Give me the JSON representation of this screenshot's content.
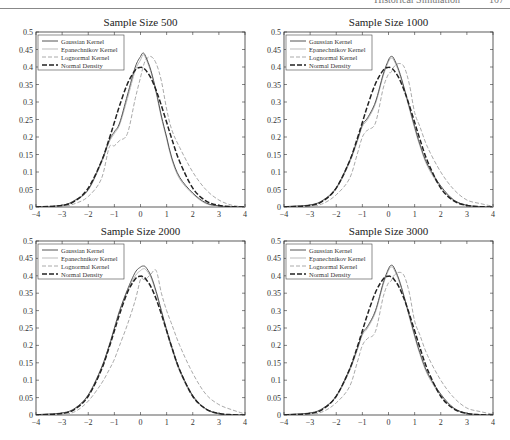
{
  "header": {
    "running_title": "Historical Simulation",
    "page_number": "107"
  },
  "legend": [
    "Gaussian Kernel",
    "Epanechnikov Kernel",
    "Lognormal Kernel",
    "Normal Density"
  ],
  "series_styles": {
    "Gaussian Kernel": {
      "color": "#555555",
      "dash": "",
      "width": 1.0
    },
    "Epanechnikov Kernel": {
      "color": "#bbbbbb",
      "dash": "",
      "width": 1.0
    },
    "Lognormal Kernel": {
      "color": "#aaaaaa",
      "dash": "4,2",
      "width": 1.0
    },
    "Normal Density": {
      "color": "#222222",
      "dash": "5,2",
      "width": 1.5
    }
  },
  "chart_data": [
    {
      "type": "line",
      "title": "Sample Size 500",
      "xlabel": "",
      "ylabel": "",
      "xlim": [
        -4,
        4
      ],
      "ylim": [
        0,
        0.5
      ],
      "xticks": [
        -4,
        -3,
        -2,
        -1,
        0,
        1,
        2,
        3,
        4
      ],
      "yticks": [
        0,
        0.05,
        0.1,
        0.15,
        0.2,
        0.25,
        0.3,
        0.35,
        0.4,
        0.45,
        0.5
      ],
      "grid": false,
      "legend_position": "upper left",
      "x": [
        -4,
        -3,
        -2.5,
        -2,
        -1.5,
        -1.2,
        -1,
        -0.8,
        -0.5,
        -0.2,
        0,
        0.1,
        0.2,
        0.4,
        0.6,
        0.8,
        1,
        1.2,
        1.5,
        2,
        2.5,
        3,
        3.5,
        4
      ],
      "series": [
        {
          "name": "Gaussian Kernel",
          "values": [
            0,
            0.005,
            0.02,
            0.05,
            0.13,
            0.19,
            0.215,
            0.24,
            0.32,
            0.4,
            0.43,
            0.44,
            0.43,
            0.39,
            0.33,
            0.26,
            0.2,
            0.14,
            0.085,
            0.04,
            0.012,
            0.003,
            0.001,
            0
          ]
        },
        {
          "name": "Epanechnikov Kernel",
          "values": [
            0,
            0.004,
            0.018,
            0.048,
            0.125,
            0.185,
            0.21,
            0.235,
            0.31,
            0.39,
            0.42,
            0.435,
            0.425,
            0.385,
            0.325,
            0.255,
            0.195,
            0.135,
            0.08,
            0.037,
            0.01,
            0.002,
            0,
            0
          ]
        },
        {
          "name": "Lognormal Kernel",
          "values": [
            0,
            0.002,
            0.01,
            0.03,
            0.08,
            0.17,
            0.175,
            0.19,
            0.21,
            0.31,
            0.37,
            0.4,
            0.42,
            0.43,
            0.41,
            0.36,
            0.28,
            0.22,
            0.17,
            0.1,
            0.05,
            0.02,
            0.005,
            0
          ]
        },
        {
          "name": "Normal Density",
          "values": [
            0.0001,
            0.0044,
            0.0175,
            0.054,
            0.1295,
            0.1942,
            0.242,
            0.2897,
            0.3521,
            0.391,
            0.3989,
            0.397,
            0.391,
            0.3683,
            0.3332,
            0.2897,
            0.242,
            0.1942,
            0.1295,
            0.054,
            0.0175,
            0.0044,
            0.0009,
            0.0001
          ]
        }
      ]
    },
    {
      "type": "line",
      "title": "Sample Size 1000",
      "xlabel": "",
      "ylabel": "",
      "xlim": [
        -4,
        4
      ],
      "ylim": [
        0,
        0.5
      ],
      "xticks": [
        -4,
        -3,
        -2,
        -1,
        0,
        1,
        2,
        3,
        4
      ],
      "yticks": [
        0,
        0.05,
        0.1,
        0.15,
        0.2,
        0.25,
        0.3,
        0.35,
        0.4,
        0.45,
        0.5
      ],
      "grid": false,
      "legend_position": "upper left",
      "x": [
        -4,
        -3,
        -2.5,
        -2,
        -1.5,
        -1.2,
        -1,
        -0.8,
        -0.5,
        -0.2,
        0,
        0.1,
        0.2,
        0.4,
        0.6,
        0.8,
        1,
        1.2,
        1.5,
        2,
        2.5,
        3,
        3.5,
        4
      ],
      "series": [
        {
          "name": "Gaussian Kernel",
          "values": [
            0.001,
            0.006,
            0.02,
            0.055,
            0.13,
            0.19,
            0.235,
            0.255,
            0.3,
            0.38,
            0.42,
            0.43,
            0.425,
            0.39,
            0.34,
            0.285,
            0.23,
            0.18,
            0.12,
            0.06,
            0.02,
            0.005,
            0.001,
            0
          ]
        },
        {
          "name": "Epanechnikov Kernel",
          "values": [
            0.001,
            0.005,
            0.018,
            0.052,
            0.125,
            0.185,
            0.23,
            0.25,
            0.295,
            0.375,
            0.415,
            0.425,
            0.42,
            0.385,
            0.335,
            0.28,
            0.225,
            0.175,
            0.115,
            0.055,
            0.018,
            0.004,
            0.001,
            0
          ]
        },
        {
          "name": "Lognormal Kernel",
          "values": [
            0,
            0.002,
            0.01,
            0.035,
            0.08,
            0.15,
            0.2,
            0.22,
            0.24,
            0.34,
            0.38,
            0.385,
            0.4,
            0.41,
            0.4,
            0.35,
            0.27,
            0.23,
            0.17,
            0.1,
            0.05,
            0.02,
            0.01,
            0.002
          ]
        },
        {
          "name": "Normal Density",
          "values": [
            0.0001,
            0.0044,
            0.0175,
            0.054,
            0.1295,
            0.1942,
            0.242,
            0.2897,
            0.3521,
            0.391,
            0.3989,
            0.397,
            0.391,
            0.3683,
            0.3332,
            0.2897,
            0.242,
            0.1942,
            0.1295,
            0.054,
            0.0175,
            0.0044,
            0.0009,
            0.0001
          ]
        }
      ]
    },
    {
      "type": "line",
      "title": "Sample Size 2000",
      "xlabel": "",
      "ylabel": "",
      "xlim": [
        -4,
        4
      ],
      "ylim": [
        0,
        0.5
      ],
      "xticks": [
        -4,
        -3,
        -2,
        -1,
        0,
        1,
        2,
        3,
        4
      ],
      "yticks": [
        0,
        0.05,
        0.1,
        0.15,
        0.2,
        0.25,
        0.3,
        0.35,
        0.4,
        0.45,
        0.5
      ],
      "grid": false,
      "legend_position": "upper left",
      "x": [
        -4,
        -3,
        -2.5,
        -2,
        -1.5,
        -1.2,
        -1,
        -0.8,
        -0.5,
        -0.2,
        0,
        0.1,
        0.2,
        0.4,
        0.6,
        0.8,
        1,
        1.2,
        1.5,
        2,
        2.5,
        3,
        3.5,
        4
      ],
      "series": [
        {
          "name": "Gaussian Kernel",
          "values": [
            0.001,
            0.006,
            0.02,
            0.058,
            0.135,
            0.2,
            0.25,
            0.3,
            0.36,
            0.41,
            0.425,
            0.428,
            0.425,
            0.4,
            0.355,
            0.3,
            0.245,
            0.195,
            0.13,
            0.056,
            0.018,
            0.004,
            0.001,
            0
          ]
        },
        {
          "name": "Epanechnikov Kernel",
          "values": [
            0.001,
            0.005,
            0.018,
            0.055,
            0.13,
            0.195,
            0.245,
            0.295,
            0.355,
            0.4,
            0.415,
            0.42,
            0.418,
            0.395,
            0.35,
            0.295,
            0.24,
            0.19,
            0.125,
            0.052,
            0.016,
            0.003,
            0.001,
            0
          ]
        },
        {
          "name": "Lognormal Kernel",
          "values": [
            0,
            0.002,
            0.01,
            0.04,
            0.09,
            0.13,
            0.16,
            0.2,
            0.26,
            0.33,
            0.39,
            0.39,
            0.39,
            0.405,
            0.415,
            0.35,
            0.3,
            0.26,
            0.2,
            0.12,
            0.06,
            0.03,
            0.015,
            0.003
          ]
        },
        {
          "name": "Normal Density",
          "values": [
            0.0001,
            0.0044,
            0.0175,
            0.054,
            0.1295,
            0.1942,
            0.242,
            0.2897,
            0.3521,
            0.391,
            0.3989,
            0.397,
            0.391,
            0.3683,
            0.3332,
            0.2897,
            0.242,
            0.1942,
            0.1295,
            0.054,
            0.0175,
            0.0044,
            0.0009,
            0.0001
          ]
        }
      ]
    },
    {
      "type": "line",
      "title": "Sample Size 3000",
      "xlabel": "",
      "ylabel": "",
      "xlim": [
        -4,
        4
      ],
      "ylim": [
        0,
        0.5
      ],
      "xticks": [
        -4,
        -3,
        -2,
        -1,
        0,
        1,
        2,
        3,
        4
      ],
      "yticks": [
        0,
        0.05,
        0.1,
        0.15,
        0.2,
        0.25,
        0.3,
        0.35,
        0.4,
        0.45,
        0.5
      ],
      "grid": false,
      "legend_position": "upper left",
      "x": [
        -4,
        -3,
        -2.5,
        -2,
        -1.5,
        -1.2,
        -1,
        -0.8,
        -0.5,
        -0.2,
        0,
        0.1,
        0.2,
        0.4,
        0.6,
        0.8,
        1,
        1.2,
        1.5,
        2,
        2.5,
        3,
        3.5,
        4
      ],
      "series": [
        {
          "name": "Gaussian Kernel",
          "values": [
            0.001,
            0.006,
            0.02,
            0.055,
            0.13,
            0.19,
            0.235,
            0.255,
            0.3,
            0.38,
            0.42,
            0.43,
            0.425,
            0.39,
            0.34,
            0.285,
            0.23,
            0.18,
            0.12,
            0.06,
            0.02,
            0.005,
            0.001,
            0
          ]
        },
        {
          "name": "Epanechnikov Kernel",
          "values": [
            0.001,
            0.005,
            0.018,
            0.052,
            0.125,
            0.185,
            0.23,
            0.25,
            0.295,
            0.375,
            0.415,
            0.425,
            0.42,
            0.385,
            0.335,
            0.28,
            0.225,
            0.175,
            0.115,
            0.055,
            0.018,
            0.004,
            0.001,
            0
          ]
        },
        {
          "name": "Lognormal Kernel",
          "values": [
            0,
            0.002,
            0.01,
            0.035,
            0.08,
            0.15,
            0.2,
            0.22,
            0.24,
            0.34,
            0.38,
            0.385,
            0.4,
            0.41,
            0.4,
            0.35,
            0.27,
            0.23,
            0.17,
            0.1,
            0.05,
            0.02,
            0.01,
            0.002
          ]
        },
        {
          "name": "Normal Density",
          "values": [
            0.0001,
            0.0044,
            0.0175,
            0.054,
            0.1295,
            0.1942,
            0.242,
            0.2897,
            0.3521,
            0.391,
            0.3989,
            0.397,
            0.391,
            0.3683,
            0.3332,
            0.2897,
            0.242,
            0.1942,
            0.1295,
            0.054,
            0.0175,
            0.0044,
            0.0009,
            0.0001
          ]
        }
      ]
    }
  ]
}
